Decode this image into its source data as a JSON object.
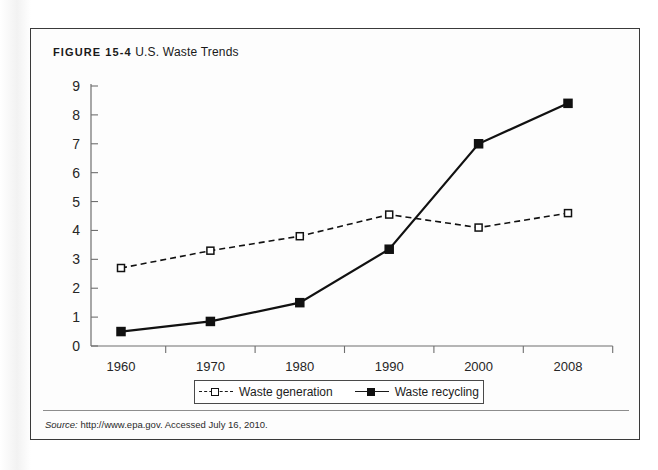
{
  "figure": {
    "label": "FIGURE 15-4",
    "name": "U.S. Waste Trends",
    "source_word": "Source:",
    "source_text": " http://www.epa.gov. Accessed July 16, 2010."
  },
  "legend": {
    "entries": [
      {
        "label": "Waste generation",
        "style": "dashed",
        "marker": "open-square"
      },
      {
        "label": "Waste recycling",
        "style": "solid",
        "marker": "filled-square"
      }
    ]
  },
  "chart_data": {
    "type": "line",
    "title": "U.S. Waste Trends",
    "xlabel": "",
    "ylabel": "",
    "categories": [
      "1960",
      "1970",
      "1980",
      "1990",
      "2000",
      "2008"
    ],
    "series": [
      {
        "name": "Waste generation",
        "values": [
          2.7,
          3.3,
          3.8,
          4.55,
          4.1,
          4.6
        ]
      },
      {
        "name": "Waste recycling",
        "values": [
          0.5,
          0.85,
          1.5,
          3.35,
          7.0,
          8.4
        ]
      }
    ],
    "ylim": [
      0,
      9
    ],
    "yticks": [
      "0",
      "1",
      "2",
      "3",
      "4",
      "5",
      "6",
      "7",
      "8",
      "9"
    ],
    "xticks": [
      "1960",
      "1970",
      "1980",
      "1990",
      "2000",
      "2008"
    ],
    "grid": false,
    "legend_position": "bottom",
    "colors": {
      "line": "#111111",
      "axis": "#6f6f6f",
      "text": "#262626"
    }
  }
}
